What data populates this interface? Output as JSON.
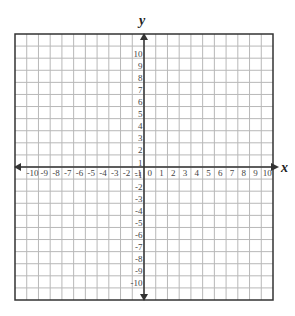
{
  "diagram": {
    "type": "coordinate-plane",
    "x_axis": {
      "label": "x",
      "min": -10,
      "max": 10,
      "step": 1,
      "tick_labels": [
        "-10",
        "-9",
        "-8",
        "-7",
        "-6",
        "-5",
        "-4",
        "-3",
        "-2",
        "-1",
        "0",
        "1",
        "2",
        "3",
        "4",
        "5",
        "6",
        "7",
        "8",
        "9",
        "10"
      ]
    },
    "y_axis": {
      "label": "y",
      "min": -10,
      "max": 10,
      "step": 1,
      "tick_labels": [
        "10",
        "9",
        "8",
        "7",
        "6",
        "5",
        "4",
        "3",
        "2",
        "1",
        "-1",
        "-2",
        "-3",
        "-4",
        "-5",
        "-6",
        "-7",
        "-8",
        "-9",
        "-10"
      ]
    },
    "grid": {
      "cells_per_side": 22,
      "origin_label": "0"
    },
    "colors": {
      "grid_line": "#b8b8b8",
      "axis_line": "#333333",
      "border": "#333333",
      "label": "#444444",
      "background": "#ffffff"
    }
  }
}
